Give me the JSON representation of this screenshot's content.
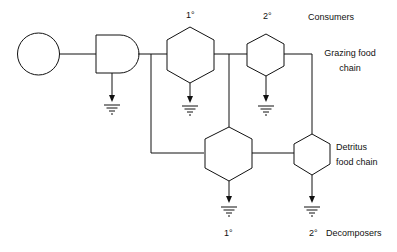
{
  "diagram": {
    "labels": {
      "primary_consumer_top": "1°",
      "secondary_consumer_top": "2°",
      "consumers": "Consumers",
      "grazing_line1": "Grazing food",
      "grazing_line2": "chain",
      "detritus_line1": "Detritus",
      "detritus_line2": "food chain",
      "primary_decomposer": "1°",
      "secondary_decomposer": "2°",
      "decomposers": "Decomposers"
    },
    "nodes": [
      {
        "id": "energy-source",
        "shape": "circle"
      },
      {
        "id": "producer",
        "shape": "d-shape"
      },
      {
        "id": "primary-consumer",
        "shape": "hexagon"
      },
      {
        "id": "secondary-consumer",
        "shape": "hexagon"
      },
      {
        "id": "primary-decomposer",
        "shape": "hexagon"
      },
      {
        "id": "secondary-decomposer",
        "shape": "hexagon"
      }
    ],
    "colors": {
      "stroke": "#111111",
      "background": "#ffffff"
    }
  }
}
